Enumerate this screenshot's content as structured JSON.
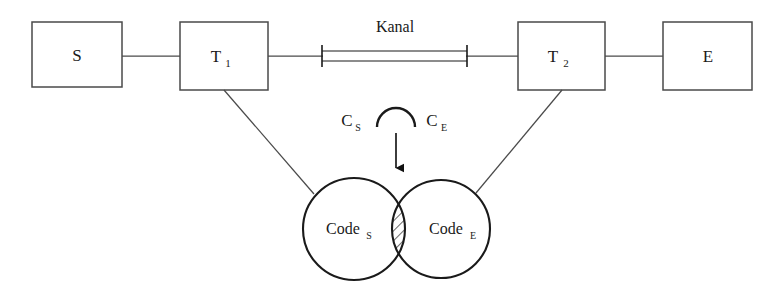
{
  "diagram": {
    "type": "communication-model-diagram",
    "background_color": "#ffffff",
    "stroke_color": "#3a3a3a",
    "heavy_stroke_color": "#1a1a1a",
    "boxes": [
      {
        "id": "sender",
        "label": "S",
        "subscript": "",
        "x": 32,
        "y": 22,
        "w": 90,
        "h": 65
      },
      {
        "id": "transmitter",
        "label": "T",
        "subscript": "1",
        "x": 180,
        "y": 22,
        "w": 88,
        "h": 68
      },
      {
        "id": "receiver",
        "label": "T",
        "subscript": "2",
        "x": 518,
        "y": 22,
        "w": 87,
        "h": 68
      },
      {
        "id": "empfaenger",
        "label": "E",
        "subscript": "",
        "x": 663,
        "y": 22,
        "w": 89,
        "h": 68
      }
    ],
    "channel": {
      "label": "Kanal",
      "x1": 322,
      "x2": 467,
      "y": 56,
      "label_x": 395,
      "label_y": 30
    },
    "set_operation": {
      "left_label": "C",
      "left_subscript": "S",
      "right_label": "C",
      "right_subscript": "E",
      "operator": "intersection-arc",
      "operator_symbol": "∩",
      "arrow": "down-arrow"
    },
    "venn": {
      "left_circle": {
        "label": "Code",
        "subscript": "S",
        "cx": 354,
        "cy": 229,
        "r": 51
      },
      "right_circle": {
        "label": "Code",
        "subscript": "E",
        "cx": 441,
        "cy": 229,
        "r": 49
      },
      "intersection_fill": "hatched"
    },
    "connectors": [
      {
        "from": "sender",
        "to": "transmitter",
        "style": "straight-horizontal"
      },
      {
        "from": "transmitter",
        "to": "channel",
        "style": "straight-horizontal"
      },
      {
        "from": "channel",
        "to": "receiver",
        "style": "straight-horizontal"
      },
      {
        "from": "receiver",
        "to": "empfaenger",
        "style": "straight-horizontal"
      },
      {
        "from": "transmitter",
        "to": "left_circle",
        "style": "diagonal"
      },
      {
        "from": "receiver",
        "to": "right_circle",
        "style": "diagonal"
      }
    ]
  }
}
